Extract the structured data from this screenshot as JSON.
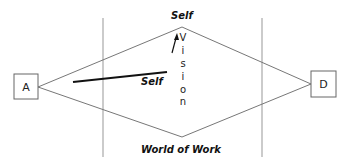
{
  "diagram": {
    "nodes": {
      "left_box": {
        "label": "A"
      },
      "right_box": {
        "label": "D"
      }
    },
    "labels": {
      "top": "Self",
      "bottom": "World of Work",
      "inner": "Self",
      "vertical": "Vision",
      "vertical_letters": [
        "V",
        "i",
        "s",
        "i",
        "o",
        "n"
      ]
    },
    "colors": {
      "line": "#777777",
      "divider": "#aaaaaa",
      "thick_line": "#111111",
      "box_border": "#666666",
      "text": "#111111"
    }
  }
}
